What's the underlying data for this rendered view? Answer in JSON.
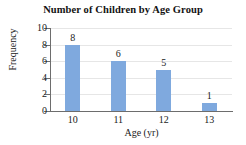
{
  "chart_data": {
    "type": "bar",
    "title": "Number of Children by Age Group",
    "xlabel": "Age (yr)",
    "ylabel": "Frequency",
    "categories": [
      "10",
      "11",
      "12",
      "13"
    ],
    "values": [
      8,
      6,
      5,
      1
    ],
    "value_labels": [
      "8",
      "6",
      "5",
      "1"
    ],
    "ylim": [
      0,
      10
    ],
    "ytick_labels": [
      "0",
      "2",
      "4",
      "6",
      "8",
      "10"
    ],
    "ytick_values": [
      0,
      2,
      4,
      6,
      8,
      10
    ],
    "grid": true,
    "legend": false,
    "bar_color": "#7FA9DE",
    "axis_color": "#6D6D6D",
    "grid_color": "#E6E6E6",
    "background": "#FFFFFF"
  }
}
